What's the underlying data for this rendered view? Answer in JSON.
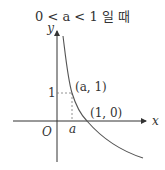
{
  "title": "0 < a < 1 일 때",
  "labels": {
    "y_axis": "y",
    "x_axis": "x",
    "origin": "O",
    "one": "1",
    "a": "a",
    "point_a1": "(a, 1)",
    "point_10": "(1, 0)"
  },
  "colors": {
    "axis": "#333333",
    "curve": "#555555",
    "guide": "#777777"
  }
}
